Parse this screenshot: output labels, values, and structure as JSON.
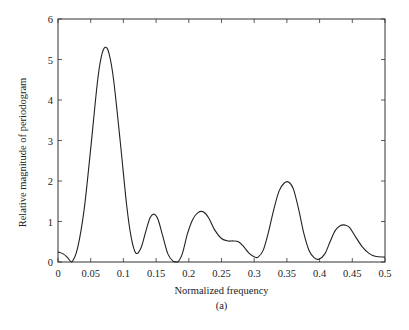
{
  "chart_data": {
    "type": "line",
    "title": "",
    "caption": "(a)",
    "xlabel": "Normalized frequency",
    "ylabel": "Relative magnitude of periodogram",
    "xlim": [
      0,
      0.5
    ],
    "ylim": [
      0,
      6
    ],
    "grid": false,
    "legend": null,
    "x_ticks": [
      0,
      0.05,
      0.1,
      0.15,
      0.2,
      0.25,
      0.3,
      0.35,
      0.4,
      0.45,
      0.5
    ],
    "x_tick_labels": [
      "0",
      "0.05",
      "0.1",
      "0.15",
      "0.2",
      "0.25",
      "0.3",
      "0.35",
      "0.4",
      "0.45",
      "0.5"
    ],
    "y_ticks": [
      0,
      1,
      2,
      3,
      4,
      5,
      6
    ],
    "y_tick_labels": [
      "0",
      "1",
      "2",
      "3",
      "4",
      "5",
      "6"
    ],
    "series": [
      {
        "name": "periodogram",
        "color": "#222222",
        "x": [
          0,
          0.008,
          0.015,
          0.021,
          0.03,
          0.04,
          0.05,
          0.06,
          0.066,
          0.072,
          0.078,
          0.085,
          0.095,
          0.105,
          0.112,
          0.119,
          0.127,
          0.135,
          0.141,
          0.147,
          0.153,
          0.16,
          0.168,
          0.176,
          0.183,
          0.19,
          0.198,
          0.206,
          0.214,
          0.222,
          0.23,
          0.24,
          0.25,
          0.26,
          0.268,
          0.276,
          0.284,
          0.292,
          0.3,
          0.306,
          0.314,
          0.322,
          0.33,
          0.338,
          0.346,
          0.353,
          0.36,
          0.368,
          0.376,
          0.384,
          0.392,
          0.399,
          0.408,
          0.416,
          0.424,
          0.432,
          0.439,
          0.446,
          0.455,
          0.465,
          0.475,
          0.485,
          0.5
        ],
        "y": [
          0.25,
          0.2,
          0.1,
          0.0,
          0.35,
          1.3,
          2.8,
          4.4,
          5.05,
          5.3,
          5.15,
          4.5,
          3.0,
          1.4,
          0.6,
          0.22,
          0.35,
          0.8,
          1.1,
          1.18,
          1.05,
          0.65,
          0.2,
          0.02,
          0.0,
          0.2,
          0.7,
          1.05,
          1.22,
          1.24,
          1.1,
          0.78,
          0.58,
          0.52,
          0.52,
          0.5,
          0.38,
          0.22,
          0.13,
          0.12,
          0.3,
          0.75,
          1.3,
          1.75,
          1.95,
          1.97,
          1.8,
          1.3,
          0.7,
          0.28,
          0.1,
          0.07,
          0.2,
          0.5,
          0.78,
          0.9,
          0.91,
          0.85,
          0.62,
          0.38,
          0.22,
          0.14,
          0.12
        ]
      }
    ]
  },
  "layout": {
    "plot_left": 58,
    "plot_right": 385,
    "plot_top": 19,
    "plot_bottom": 262
  }
}
